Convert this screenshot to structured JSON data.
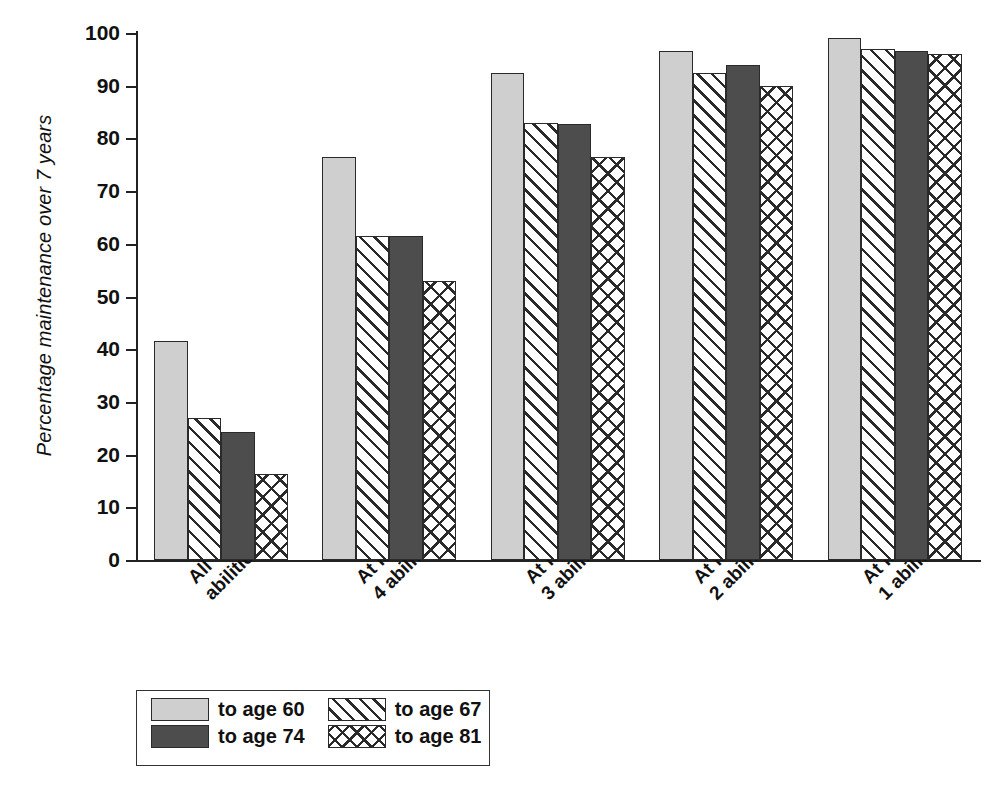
{
  "chart_data": {
    "type": "bar",
    "title": "",
    "subtitle": "",
    "xlabel": "",
    "ylabel": "Percentage maintenance over 7 years",
    "ylim": [
      0,
      100
    ],
    "ytick_labels": [
      "0",
      "10",
      "20",
      "30",
      "40",
      "50",
      "60",
      "70",
      "80",
      "90",
      "100"
    ],
    "ytick_values": [
      0,
      10,
      20,
      30,
      40,
      50,
      60,
      70,
      80,
      90,
      100
    ],
    "grid": false,
    "legend_position": "below-left",
    "categories": [
      "All abilities",
      "At least 4 abilities",
      "At least 3 abilities",
      "At least 2 abilities",
      "At least 1 ability"
    ],
    "category_lines": [
      [
        "All",
        "abilities"
      ],
      [
        "At least",
        "4 abilities"
      ],
      [
        "At least",
        "3 abilities"
      ],
      [
        "At least",
        "2 abilities"
      ],
      [
        "At least",
        "1 ability"
      ]
    ],
    "series": [
      {
        "name": "to age 60",
        "pattern": "solid-light",
        "color": "#cfcfcf",
        "values": [
          41.5,
          76.5,
          92.5,
          96.5,
          99.0
        ]
      },
      {
        "name": "to age 67",
        "pattern": "diagonal-hatch",
        "color": "#ffffff",
        "values": [
          27.0,
          61.5,
          83.0,
          92.5,
          97.0
        ]
      },
      {
        "name": "to age 74",
        "pattern": "solid-dark",
        "color": "#4d4d4d",
        "values": [
          24.3,
          61.5,
          82.7,
          94.0,
          96.5
        ]
      },
      {
        "name": "to age 81",
        "pattern": "cross-hatch",
        "color": "#ffffff",
        "values": [
          16.3,
          53.0,
          76.5,
          90.0,
          96.0
        ]
      }
    ]
  },
  "legend": {
    "entries": [
      {
        "label": "to age 60",
        "pattern": "solid-light"
      },
      {
        "label": "to age 67",
        "pattern": "diagonal-hatch"
      },
      {
        "label": "to age 74",
        "pattern": "solid-dark"
      },
      {
        "label": "to age 81",
        "pattern": "cross-hatch"
      }
    ]
  },
  "colors": {
    "light_gray": "#cfcfcf",
    "dark_gray": "#4d4d4d",
    "outline": "#2a2a2a",
    "background": "#ffffff"
  }
}
